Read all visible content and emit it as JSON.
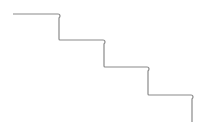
{
  "diagram": {
    "type": "staircase-line",
    "stroke_color": "#8a8a8a",
    "background": "#ffffff",
    "steps": [
      {
        "h": [
          13,
          14,
          59
        ],
        "v": [
          59,
          14,
          40
        ]
      },
      {
        "h": [
          59,
          40,
          104
        ],
        "v": [
          104,
          40,
          67
        ]
      },
      {
        "h": [
          104,
          67,
          148
        ],
        "v": [
          148,
          67,
          95
        ]
      },
      {
        "h": [
          148,
          95,
          192
        ],
        "v": [
          192,
          95,
          122
        ]
      }
    ]
  }
}
